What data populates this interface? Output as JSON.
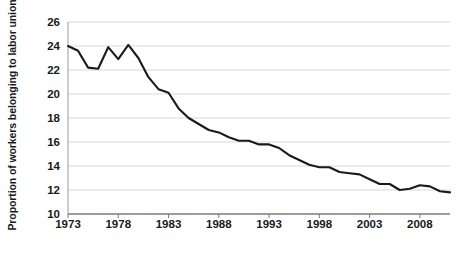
{
  "chart_data": {
    "type": "line",
    "title": "",
    "xlabel": "",
    "ylabel": "Proportion of workers belonging to labor union",
    "xlim": [
      1973,
      2011
    ],
    "ylim": [
      10,
      26
    ],
    "ytick_labels": [
      "26",
      "24",
      "22",
      "20",
      "18",
      "16",
      "14",
      "12",
      "10"
    ],
    "ytick_values": [
      26,
      24,
      22,
      20,
      18,
      16,
      14,
      12,
      10
    ],
    "xtick_labels": [
      "1973",
      "1978",
      "1983",
      "1988",
      "1993",
      "1998",
      "2003",
      "2008"
    ],
    "xtick_values": [
      1973,
      1978,
      1983,
      1988,
      1993,
      1998,
      2003,
      2008
    ],
    "grid": true,
    "legend": "none",
    "series": [
      {
        "name": "Union membership rate",
        "color": "#1a1a1a",
        "x": [
          1973,
          1974,
          1975,
          1976,
          1977,
          1978,
          1979,
          1980,
          1981,
          1982,
          1983,
          1984,
          1985,
          1986,
          1987,
          1988,
          1989,
          1990,
          1991,
          1992,
          1993,
          1994,
          1995,
          1996,
          1997,
          1998,
          1999,
          2000,
          2001,
          2002,
          2003,
          2004,
          2005,
          2006,
          2007,
          2008,
          2009,
          2010,
          2011
        ],
        "values": [
          24.0,
          23.6,
          22.2,
          22.1,
          23.9,
          22.9,
          24.1,
          23.0,
          21.4,
          20.4,
          20.1,
          18.8,
          18.0,
          17.5,
          17.0,
          16.8,
          16.4,
          16.1,
          16.1,
          15.8,
          15.8,
          15.5,
          14.9,
          14.5,
          14.1,
          13.9,
          13.9,
          13.5,
          13.4,
          13.3,
          12.9,
          12.5,
          12.5,
          12.0,
          12.1,
          12.4,
          12.3,
          11.9,
          11.8
        ]
      }
    ]
  }
}
